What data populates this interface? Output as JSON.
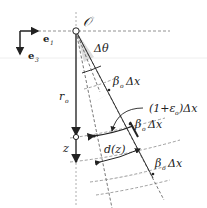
{
  "diagram": {
    "origin_label": "𝒪",
    "axis_e1_label": "e",
    "axis_e1_sub": "1",
    "axis_e3_label": "e",
    "axis_e3_sub": "3",
    "angle_label": "Δθ",
    "radius_label": "r",
    "radius_sub": "o",
    "depth_label": "z",
    "beta_label_1": "β",
    "beta_sub": "o",
    "beta_suffix": "Δx",
    "stretch_label": "(1+ε",
    "stretch_sub": "o",
    "stretch_suffix": ")Δx",
    "distance_label": "d(z)"
  }
}
